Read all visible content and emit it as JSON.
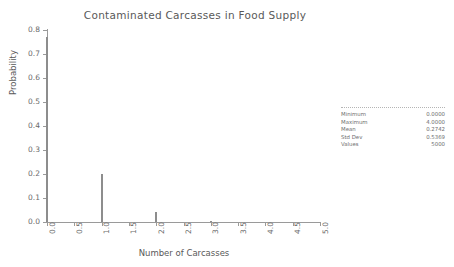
{
  "chart_data": {
    "type": "bar",
    "title": "Contaminated Carcasses in Food Supply",
    "xlabel": "Number of Carcasses",
    "ylabel": "Probability",
    "xlim": [
      0.0,
      5.0
    ],
    "ylim": [
      0.0,
      0.8
    ],
    "grid": false,
    "legend": "none",
    "x": [
      0,
      1,
      2,
      3
    ],
    "values": [
      0.77,
      0.198,
      0.04,
      0.006
    ],
    "categories": [
      "0",
      "1",
      "2",
      "3"
    ],
    "xticks": [
      "0.0",
      "0.5",
      "1.0",
      "1.5",
      "2.0",
      "2.5",
      "3.0",
      "3.5",
      "4.0",
      "4.5",
      "5.0"
    ],
    "xtick_values": [
      0.0,
      0.5,
      1.0,
      1.5,
      2.0,
      2.5,
      3.0,
      3.5,
      4.0,
      4.5,
      5.0
    ],
    "yticks": [
      "0.0",
      "0.1",
      "0.2",
      "0.3",
      "0.4",
      "0.5",
      "0.6",
      "0.7",
      "0.8"
    ],
    "ytick_values": [
      0.0,
      0.1,
      0.2,
      0.3,
      0.4,
      0.5,
      0.6,
      0.7,
      0.8
    ],
    "bar_color": "#8d8d8d",
    "axis_color": "#9a9a9a"
  },
  "stats": {
    "rows": [
      {
        "label": "Minimum",
        "value": "0.0000"
      },
      {
        "label": "Maximum",
        "value": "4.0000"
      },
      {
        "label": "Mean",
        "value": "0.2742"
      },
      {
        "label": "Std Dev",
        "value": "0.5369"
      },
      {
        "label": "Values",
        "value": "5000"
      }
    ]
  }
}
